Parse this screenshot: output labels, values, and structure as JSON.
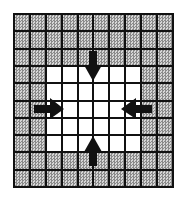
{
  "diagram": {
    "type": "grid-inward-arrows",
    "grid": {
      "columns": 10,
      "rows": 10,
      "shaded_color": "#a8a8a8",
      "line_color": "#111111",
      "white_region": {
        "col_start": 2,
        "col_end": 7,
        "row_start": 3,
        "row_end": 7
      }
    },
    "arrows": [
      {
        "direction": "down",
        "position": "top"
      },
      {
        "direction": "right",
        "position": "left"
      },
      {
        "direction": "left",
        "position": "right"
      },
      {
        "direction": "up",
        "position": "bottom"
      }
    ]
  }
}
